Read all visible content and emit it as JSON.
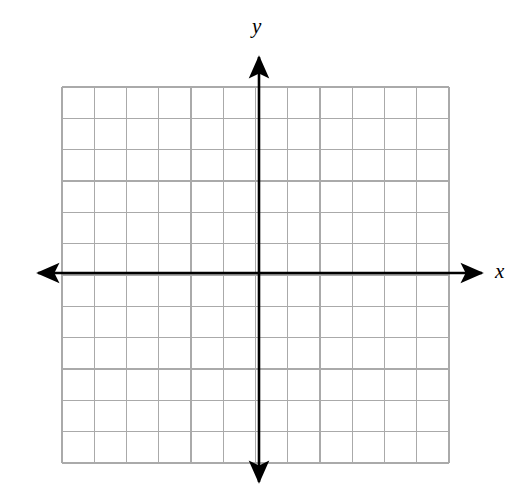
{
  "figure": {
    "title": "",
    "width": 530,
    "height": 499,
    "background_color": "#ffffff"
  },
  "axis_labels": {
    "x": "x",
    "y": "y"
  },
  "colors": {
    "grid_line": "#aaaaaa",
    "axis_line": "#000000",
    "background": "#ffffff",
    "label": "#000000"
  },
  "chart_data": {
    "type": "scatter",
    "title": "",
    "subtitle": "",
    "xlabel": "x",
    "ylabel": "y",
    "series": [],
    "annotations": [],
    "legend": null,
    "grid": true,
    "grid_columns": 12,
    "grid_rows": 12,
    "grid_cell_px": 32.2,
    "xlim": [
      -6,
      6
    ],
    "ylim": [
      -6.2,
      5.8
    ],
    "xticks": [
      -6,
      -5,
      -4,
      -3,
      -2,
      -1,
      0,
      1,
      2,
      3,
      4,
      5,
      6
    ],
    "yticks": [
      -6,
      -5,
      -4,
      -3,
      -2,
      -1,
      0,
      1,
      2,
      3,
      4,
      5
    ],
    "xtick_labels": [],
    "ytick_labels": [],
    "axes_style": "arrows-both-ends",
    "origin_px": [
      259,
      273
    ],
    "grid_bounds_px": {
      "left": 62,
      "top": 87,
      "right": 449,
      "bottom": 463
    },
    "axis_extents_px": {
      "x_left": 31,
      "x_right": 489,
      "y_top": 50,
      "y_bottom": 489
    }
  }
}
